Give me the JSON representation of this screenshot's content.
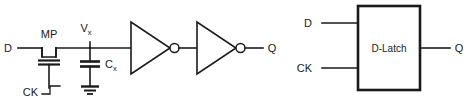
{
  "figure": {
    "background_color": "#ffffff",
    "line_color": "#1a1a1a"
  },
  "left_circuit": {
    "name": "transistor-level-dynamic-latch",
    "labels": {
      "input_d": "D",
      "transistor": "MP",
      "node_vx_base": "V",
      "node_vx_sub": "x",
      "cap_base": "C",
      "cap_sub": "x",
      "clock": "CK",
      "output_q": "Q"
    },
    "elements": {
      "pass_transistor": "MP",
      "storage_capacitor": "Cx",
      "ground": "ground-symbol",
      "inverter_1": "inverter",
      "inverter_2": "inverter",
      "clock_waveform": "rising-edge-step"
    }
  },
  "right_circuit": {
    "name": "d-latch-block-symbol",
    "labels": {
      "block": "D-Latch",
      "input_d": "D",
      "input_ck": "CK",
      "output_q": "Q"
    }
  }
}
